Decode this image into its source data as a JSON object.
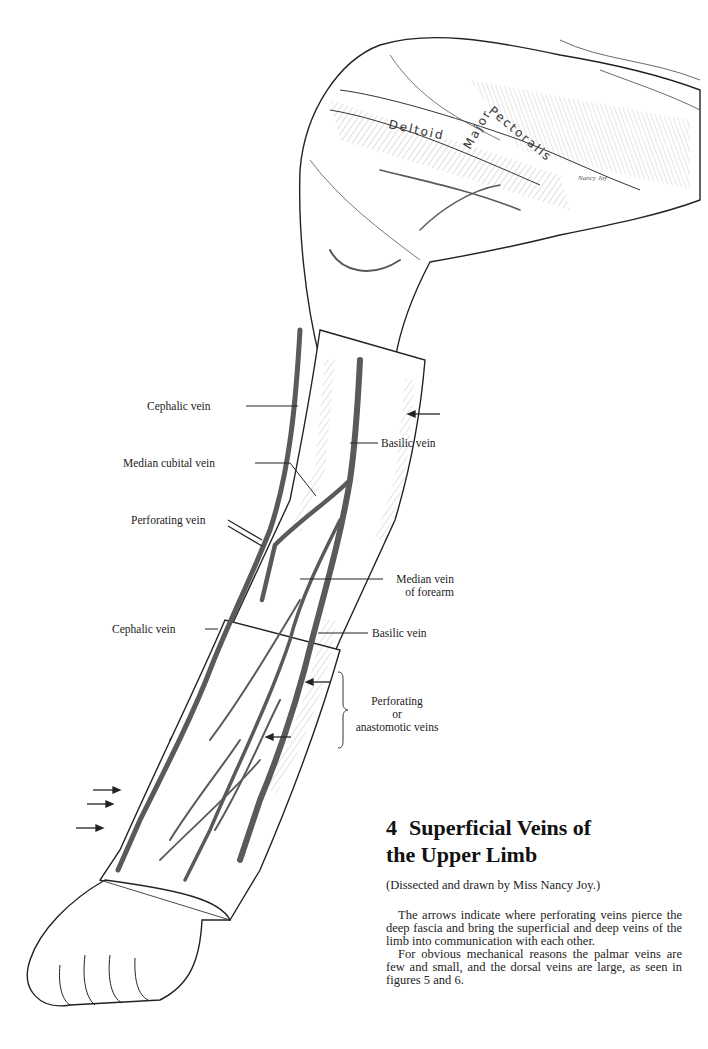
{
  "figure": {
    "number": "4",
    "title_line1": "Superficial Veins of",
    "title_line2": "the Upper Limb",
    "credit": "(Dissected and drawn by Miss Nancy Joy.)",
    "paragraphs": [
      "The arrows indicate where perforating veins pierce the deep fascia and bring the superficial and deep veins of the limb into communication with each other.",
      "For obvious mechanical reasons the palmar veins are few and small, and the dorsal veins are large, as seen in figures 5 and 6."
    ]
  },
  "illustration": {
    "muscle_labels": {
      "deltoid": "Deltoid",
      "pectoralis": "Pectoralis",
      "major": "Major"
    },
    "signature": "Nancy Joy",
    "labels": {
      "cephalic_vein_upper": "Cephalic vein",
      "basilic_vein_upper": "Basilic vein",
      "median_cubital_vein": "Median cubital vein",
      "perforating_vein": "Perforating vein",
      "median_vein_line1": "Median vein",
      "median_vein_line2": "of forearm",
      "cephalic_vein_lower": "Cephalic vein",
      "basilic_vein_lower": "Basilic vein",
      "perforating_line1": "Perforating",
      "perforating_line2": "or",
      "perforating_line3": "anastomotic veins"
    },
    "colors": {
      "ink": "#1a1a1a",
      "vein": "#5a5a5a",
      "paper": "#ffffff"
    }
  }
}
